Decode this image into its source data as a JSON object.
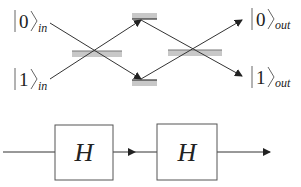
{
  "interferometer": {
    "inputs": [
      {
        "state": "0",
        "subscript": "in"
      },
      {
        "state": "1",
        "subscript": "in"
      }
    ],
    "outputs": [
      {
        "state": "0",
        "subscript": "out"
      },
      {
        "state": "1",
        "subscript": "out"
      }
    ],
    "components": [
      "beam-splitter",
      "mirror-top",
      "mirror-bottom",
      "beam-splitter"
    ]
  },
  "circuit": {
    "gates": [
      {
        "label": "H"
      },
      {
        "label": "H"
      }
    ]
  },
  "colors": {
    "line": "#333333",
    "splitter_fill": "#c8c8c8",
    "box_stroke": "#555555"
  }
}
